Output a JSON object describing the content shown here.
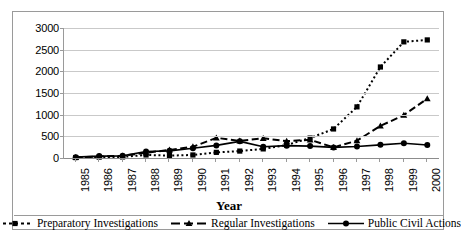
{
  "chart_data": {
    "type": "line",
    "title": "",
    "xlabel": "Year",
    "ylabel": "",
    "ylim": [
      0,
      3000
    ],
    "yticks": [
      0,
      500,
      1000,
      1500,
      2000,
      2500,
      3000
    ],
    "grid": true,
    "legend_position": "bottom",
    "categories": [
      "1985",
      "1986",
      "1987",
      "1988",
      "1989",
      "1990",
      "1991",
      "1992",
      "1993",
      "1994",
      "1995",
      "1996",
      "1997",
      "1998",
      "1999",
      "2000"
    ],
    "series": [
      {
        "name": "Preparatory Investigations",
        "marker": "square",
        "line_style": "dotted",
        "color": "#000000",
        "values": [
          10,
          20,
          25,
          70,
          55,
          70,
          130,
          160,
          210,
          300,
          460,
          670,
          1180,
          2100,
          2680,
          2725
        ]
      },
      {
        "name": "Regular Investigations",
        "marker": "triangle",
        "line_style": "dashed",
        "color": "#000000",
        "values": [
          15,
          35,
          50,
          120,
          185,
          260,
          465,
          395,
          455,
          390,
          420,
          245,
          400,
          740,
          990,
          1370
        ]
      },
      {
        "name": "Public Civil Actions",
        "marker": "circle",
        "line_style": "solid",
        "color": "#000000",
        "values": [
          20,
          45,
          50,
          150,
          165,
          225,
          290,
          385,
          260,
          285,
          275,
          245,
          265,
          305,
          340,
          300
        ]
      }
    ]
  },
  "axis": {
    "x_title": "Year"
  },
  "legend": {
    "items": [
      {
        "label": "Preparatory Investigations"
      },
      {
        "label": "Regular Investigations"
      },
      {
        "label": "Public Civil Actions"
      }
    ]
  }
}
